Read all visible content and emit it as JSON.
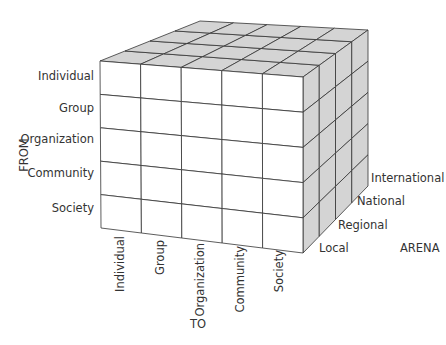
{
  "diagram": {
    "type": "3d-cube-matrix",
    "axes": {
      "from": {
        "title": "FROM",
        "labels": [
          "Individual",
          "Group",
          "Organization",
          "Community",
          "Society"
        ]
      },
      "to": {
        "title": "TO",
        "labels": [
          "Individual",
          "Group",
          "Organization",
          "Community",
          "Society"
        ]
      },
      "arena": {
        "title": "ARENA",
        "labels": [
          "Local",
          "Regional",
          "National",
          "International"
        ]
      }
    },
    "colors": {
      "front_face": "#ffffff",
      "top_face": "#d4d4d4",
      "side_face": "#d4d4d4",
      "lines": "#333333"
    }
  }
}
